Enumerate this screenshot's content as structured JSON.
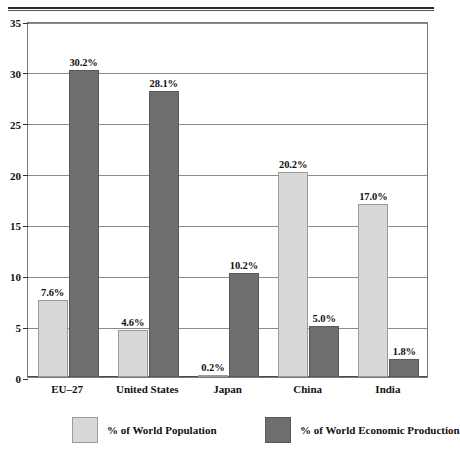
{
  "chart_data": {
    "type": "bar",
    "title": "",
    "xlabel": "",
    "ylabel": "",
    "ylim": [
      0,
      35
    ],
    "yticks": [
      0,
      5,
      10,
      15,
      20,
      25,
      30,
      35
    ],
    "grid": true,
    "legend_position": "bottom",
    "categories": [
      "EU–27",
      "United States",
      "Japan",
      "China",
      "India"
    ],
    "series": [
      {
        "name": "% of World Population",
        "color": "#d8d8d8",
        "values": [
          7.6,
          4.6,
          0.2,
          20.2,
          17.0
        ],
        "labels": [
          "7.6%",
          "4.6%",
          "0.2%",
          "20.2%",
          "17.0%"
        ]
      },
      {
        "name": "% of World Economic Production",
        "color": "#6e6e6e",
        "values": [
          30.2,
          28.1,
          10.2,
          5.0,
          1.8
        ],
        "labels": [
          "30.2%",
          "28.1%",
          "10.2%",
          "5.0%",
          "1.8%"
        ]
      }
    ]
  },
  "axis": {
    "ytick_labels": [
      "0",
      "5",
      "10",
      "15",
      "20",
      "25",
      "30",
      "35"
    ]
  },
  "legend": {
    "items": [
      {
        "label": "% of World Population",
        "color": "#d8d8d8"
      },
      {
        "label": "% of World Economic Production",
        "color": "#6e6e6e"
      }
    ]
  }
}
